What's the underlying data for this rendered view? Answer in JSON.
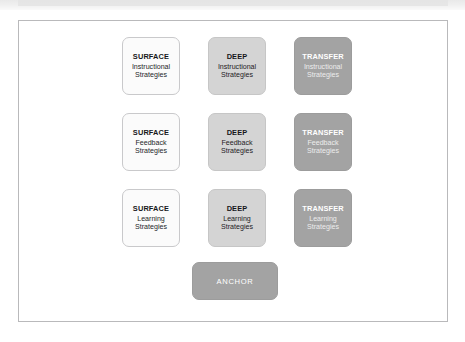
{
  "diagram": {
    "type": "matrix",
    "columns": [
      "SURFACE",
      "DEEP",
      "TRANSFER"
    ],
    "rows": [
      "Instructional Strategies",
      "Feedback Strategies",
      "Learning Strategies"
    ],
    "cells": [
      [
        {
          "title": "SURFACE",
          "sub_line1": "Instructional",
          "sub_line2": "Strategies",
          "style": "surface"
        },
        {
          "title": "DEEP",
          "sub_line1": "Instructional",
          "sub_line2": "Strategies",
          "style": "deep"
        },
        {
          "title": "TRANSFER",
          "sub_line1": "Instructional",
          "sub_line2": "Strategies",
          "style": "transfer"
        }
      ],
      [
        {
          "title": "SURFACE",
          "sub_line1": "Feedback",
          "sub_line2": "Strategies",
          "style": "surface"
        },
        {
          "title": "DEEP",
          "sub_line1": "Feedback",
          "sub_line2": "Strategies",
          "style": "deep"
        },
        {
          "title": "TRANSFER",
          "sub_line1": "Feedback",
          "sub_line2": "Strategies",
          "style": "transfer"
        }
      ],
      [
        {
          "title": "SURFACE",
          "sub_line1": "Learning",
          "sub_line2": "Strategies",
          "style": "surface"
        },
        {
          "title": "DEEP",
          "sub_line1": "Learning",
          "sub_line2": "Strategies",
          "style": "deep"
        },
        {
          "title": "TRANSFER",
          "sub_line1": "Learning",
          "sub_line2": "Strategies",
          "style": "transfer"
        }
      ]
    ],
    "anchor": {
      "label": "ANCHOR"
    },
    "colors": {
      "surface_fill": "#fbfbfb",
      "surface_border": "#c9c9cb",
      "surface_text": "#17181a",
      "deep_fill": "#d4d4d4",
      "deep_text": "#16171a",
      "transfer_fill": "#a3a3a3",
      "transfer_text": "#ffffff",
      "anchor_fill": "#a3a3a3",
      "anchor_text": "#ffffff",
      "frame_border": "#b9b9bb",
      "page_background": "#ffffff"
    }
  }
}
